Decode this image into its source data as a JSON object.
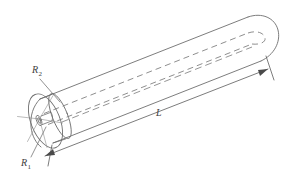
{
  "figure": {
    "type": "engineering-line-drawing",
    "background_color": "#ffffff",
    "line_color": "#6e6e6e",
    "dashed_line_color": "#7a7a7a",
    "text_color": "#404040",
    "labels": [
      {
        "id": "outer-radius",
        "symbol": "R",
        "subscript": "2",
        "full_text": "R2",
        "x": 32,
        "y": 72,
        "description": "outer radius of the cylinder"
      },
      {
        "id": "inner-radius",
        "symbol": "R",
        "subscript": "1",
        "full_text": "R1",
        "x": 22,
        "y": 165,
        "description": "inner radius (bore) of the cylinder"
      },
      {
        "id": "length",
        "symbol": "L",
        "subscript": "",
        "full_text": "L",
        "x": 158,
        "y": 115,
        "description": "overall length of the cylinder"
      }
    ],
    "dimension_lines": [
      {
        "id": "length-dimension",
        "label": "L",
        "start": [
          44,
          155
        ],
        "end": [
          262,
          70
        ],
        "arrowheads": "both"
      }
    ],
    "leaders": [
      {
        "id": "r2-leader",
        "label": "R2",
        "from": [
          40,
          78
        ],
        "to": [
          60,
          102
        ]
      },
      {
        "id": "r1-leader",
        "label": "R1",
        "from": [
          32,
          158
        ],
        "to": [
          47,
          128
        ]
      }
    ],
    "geometry": {
      "outer_radius_label": "R2",
      "inner_radius_label": "R1",
      "length_label": "L",
      "end_left": "open annular face",
      "end_right": "rounded cap",
      "hidden_lines": "dashed, showing inner bore through the solid"
    }
  }
}
